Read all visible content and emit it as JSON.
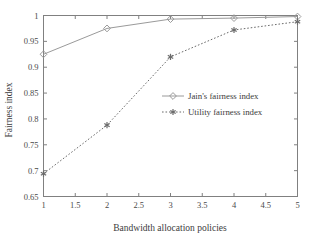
{
  "chart_data": {
    "type": "line",
    "title": "",
    "xlabel": "Bandwidth allocation policies",
    "ylabel": "Fairness index",
    "x": [
      1,
      2,
      3,
      4,
      5
    ],
    "xlim": [
      1,
      5
    ],
    "ylim": [
      0.65,
      1
    ],
    "xticks": [
      1,
      1.5,
      2,
      2.5,
      3,
      3.5,
      4,
      4.5,
      5
    ],
    "xticklabels": [
      "1",
      "1.5",
      "2",
      "2.5",
      "3",
      "3.5",
      "4",
      "4.5",
      "5"
    ],
    "yticks": [
      0.65,
      0.7,
      0.75,
      0.8,
      0.85,
      0.9,
      0.95,
      1
    ],
    "yticklabels": [
      "0.65",
      "0.7",
      "0.75",
      "0.8",
      "0.85",
      "0.9",
      "0.95",
      "1"
    ],
    "grid": false,
    "legend_position": "center-right",
    "series": [
      {
        "name": "Jain's fairness index",
        "values": [
          0.925,
          0.975,
          0.993,
          0.995,
          0.998
        ],
        "linestyle": "solid",
        "marker": "diamond",
        "color": "#9a9a9a"
      },
      {
        "name": "Utility fairness index",
        "values": [
          0.694,
          0.788,
          0.92,
          0.972,
          0.988
        ],
        "linestyle": "dotted",
        "marker": "asterisk",
        "color": "#6b6b6b"
      }
    ]
  },
  "axes": {
    "frame_color": "#808080",
    "background": "#ffffff"
  },
  "legend": {
    "items": [
      {
        "label": "Jain's fairness index"
      },
      {
        "label": "Utility fairness index"
      }
    ]
  }
}
